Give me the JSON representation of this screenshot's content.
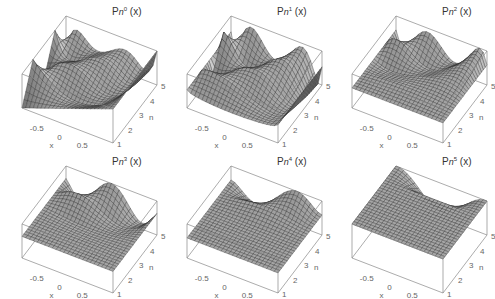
{
  "chart_data": {
    "type": "surface3d",
    "title": "",
    "layout": {
      "rows": 2,
      "cols": 3
    },
    "x_axis": {
      "label": "x",
      "range": [
        -1,
        1
      ],
      "ticks": [
        "-0.5",
        "0",
        "0.5"
      ]
    },
    "n_axis": {
      "label": "n",
      "range": [
        1,
        5
      ],
      "ticks": [
        "1",
        "2",
        "3",
        "4",
        "5"
      ]
    },
    "panels": [
      {
        "title_base": "P",
        "title_sub": "n",
        "title_sup": "0",
        "title_arg": "(x)",
        "m": 0,
        "description": "Associated Legendre P_n^0(x) surface over x in [-1,1], n in [1,5]; oscillating ridges, edge values near ±1"
      },
      {
        "title_base": "P",
        "title_sub": "n",
        "title_sup": "1",
        "title_arg": "(x)",
        "m": 1,
        "description": "P_n^1(x) surface; sharp spike at back-left, broad hump in middle"
      },
      {
        "title_base": "P",
        "title_sub": "n",
        "title_sup": "2",
        "title_arg": "(x)",
        "m": 2,
        "description": "P_n^2(x) surface; flat for small n, rising hump for larger n"
      },
      {
        "title_base": "P",
        "title_sub": "n",
        "title_sup": "3",
        "title_arg": "(x)",
        "m": 3,
        "description": "P_n^3(x) surface; flat plane for n<3, peaks at back"
      },
      {
        "title_base": "P",
        "title_sub": "n",
        "title_sup": "4",
        "title_arg": "(x)",
        "m": 4,
        "description": "P_n^4(x) surface; mostly flat with small ripple at n=5"
      },
      {
        "title_base": "P",
        "title_sub": "n",
        "title_sup": "5",
        "title_arg": "(x)",
        "m": 5,
        "description": "P_n^5(x) surface; flat except single bell-shaped hump at n=5"
      }
    ]
  }
}
